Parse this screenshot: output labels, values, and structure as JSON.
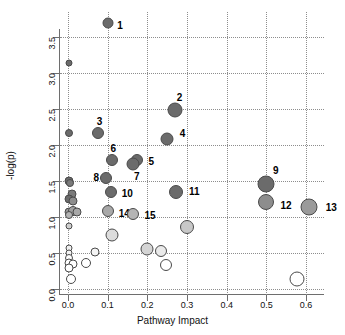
{
  "chart_data": {
    "type": "scatter",
    "title": "",
    "xlabel": "Pathway Impact",
    "ylabel": "-log(p)",
    "xlim": [
      -0.02,
      0.645
    ],
    "ylim": [
      -0.08,
      3.85
    ],
    "xticks": [
      0.0,
      0.1,
      0.2,
      0.3,
      0.4,
      0.5,
      0.6
    ],
    "xticklabels": [
      "0.0",
      "0.1",
      "0.2",
      "0.3",
      "0.4",
      "0.5",
      "0.6"
    ],
    "yticks": [
      0.0,
      0.5,
      1.0,
      1.5,
      2.0,
      2.5,
      3.0,
      3.5
    ],
    "yticklabels": [
      "0.0",
      "0.5",
      "1.0",
      "1.5",
      "2.0",
      "2.5",
      "3.0",
      "3.5"
    ],
    "grid": true,
    "grid_style": "dotted",
    "legend": "none",
    "marker_shape": "circle",
    "size_encodes": "pathway impact / node count",
    "color_encodes": "-log(p) significance, dark red-grey = high, white = low",
    "colors": {
      "high": "#6b6b6b",
      "mid": "#9a9a9a",
      "low": "#cfcfcf",
      "lowest": "#ffffff",
      "stroke": "#4a4a4a",
      "axis": "#6e6e6e",
      "grid": "#8d8d8d",
      "text": "#111111"
    },
    "points": [
      {
        "label": "1",
        "x": 0.1,
        "y": 3.7,
        "size": 11,
        "color": "#6b6b6b",
        "label_dx": 8,
        "label_dy": 2
      },
      {
        "label": "2",
        "x": 0.27,
        "y": 2.49,
        "size": 15,
        "color": "#6b6b6b",
        "label_dx": -2,
        "label_dy": -13
      },
      {
        "label": "3",
        "x": 0.075,
        "y": 2.17,
        "size": 12,
        "color": "#6b6b6b",
        "label_dx": -3,
        "label_dy": -12
      },
      {
        "label": "4",
        "x": 0.25,
        "y": 2.08,
        "size": 13,
        "color": "#6b6b6b",
        "label_dx": 10,
        "label_dy": -6
      },
      {
        "label": "5",
        "x": 0.175,
        "y": 1.8,
        "size": 12,
        "color": "#6b6b6b",
        "label_dx": 9,
        "label_dy": 1
      },
      {
        "label": "6",
        "x": 0.11,
        "y": 1.79,
        "size": 12,
        "color": "#6b6b6b",
        "label_dx": -3,
        "label_dy": -12
      },
      {
        "label": "7",
        "x": 0.165,
        "y": 1.74,
        "size": 13,
        "color": "#6b6b6b",
        "label_dx": -2,
        "label_dy": 12
      },
      {
        "label": "8",
        "x": 0.097,
        "y": 1.54,
        "size": 12,
        "color": "#6b6b6b",
        "label_dx": -15,
        "label_dy": -1
      },
      {
        "label": "9",
        "x": 0.5,
        "y": 1.455,
        "size": 17,
        "color": "#6b6b6b",
        "label_dx": 2,
        "label_dy": -14
      },
      {
        "label": "10",
        "x": 0.108,
        "y": 1.355,
        "size": 12,
        "color": "#6b6b6b",
        "label_dx": 9,
        "label_dy": 1
      },
      {
        "label": "11",
        "x": 0.272,
        "y": 1.35,
        "size": 14,
        "color": "#6b6b6b",
        "label_dx": 10,
        "label_dy": -1
      },
      {
        "label": "12",
        "x": 0.5,
        "y": 1.215,
        "size": 16,
        "color": "#8d8d8d",
        "label_dx": 10,
        "label_dy": 3
      },
      {
        "label": "13",
        "x": 0.608,
        "y": 1.145,
        "size": 17,
        "color": "#9a9a9a",
        "label_dx": 12,
        "label_dy": 0
      },
      {
        "label": "14",
        "x": 0.1,
        "y": 1.08,
        "size": 12,
        "color": "#a8a8a8",
        "label_dx": 9,
        "label_dy": 2
      },
      {
        "label": "15",
        "x": 0.165,
        "y": 1.05,
        "size": 12,
        "color": "#b4b4b4",
        "label_dx": 9,
        "label_dy": 1
      },
      {
        "label": "",
        "x": 0.003,
        "y": 3.145,
        "size": 7,
        "color": "#6b6b6b",
        "label_dx": 0,
        "label_dy": 0
      },
      {
        "label": "",
        "x": 0.003,
        "y": 2.175,
        "size": 8,
        "color": "#6b6b6b",
        "label_dx": 0,
        "label_dy": 0
      },
      {
        "label": "",
        "x": 0.003,
        "y": 1.5,
        "size": 9,
        "color": "#6b6b6b",
        "label_dx": 0,
        "label_dy": 0
      },
      {
        "label": "",
        "x": 0.004,
        "y": 1.47,
        "size": 8,
        "color": "#7b7b7b",
        "label_dx": 0,
        "label_dy": 0
      },
      {
        "label": "",
        "x": 0.01,
        "y": 1.32,
        "size": 9,
        "color": "#7b7b7b",
        "label_dx": 0,
        "label_dy": 0
      },
      {
        "label": "",
        "x": 0.003,
        "y": 1.26,
        "size": 9,
        "color": "#6b6b6b",
        "label_dx": 0,
        "label_dy": 0
      },
      {
        "label": "",
        "x": 0.012,
        "y": 1.225,
        "size": 9,
        "color": "#8d8d8d",
        "label_dx": 0,
        "label_dy": 0
      },
      {
        "label": "",
        "x": 0.002,
        "y": 1.075,
        "size": 9,
        "color": "#9a9a9a",
        "label_dx": 0,
        "label_dy": 0
      },
      {
        "label": "",
        "x": 0.012,
        "y": 1.085,
        "size": 10,
        "color": "#a0a0a0",
        "label_dx": 0,
        "label_dy": 0
      },
      {
        "label": "",
        "x": 0.022,
        "y": 1.07,
        "size": 9,
        "color": "#a8a8a8",
        "label_dx": 0,
        "label_dy": 0
      },
      {
        "label": "",
        "x": 0.003,
        "y": 1.03,
        "size": 8,
        "color": "#b4b4b4",
        "label_dx": 0,
        "label_dy": 0
      },
      {
        "label": "",
        "x": 0.002,
        "y": 0.88,
        "size": 7,
        "color": "#cfcfcf",
        "label_dx": 0,
        "label_dy": 0
      },
      {
        "label": "",
        "x": 0.002,
        "y": 0.575,
        "size": 7,
        "color": "#f0f0f0",
        "label_dx": 0,
        "label_dy": 0
      },
      {
        "label": "",
        "x": 0.002,
        "y": 0.5,
        "size": 7,
        "color": "#f4f4f4",
        "label_dx": 0,
        "label_dy": 0
      },
      {
        "label": "",
        "x": 0.002,
        "y": 0.43,
        "size": 8,
        "color": "#ffffff",
        "label_dx": 0,
        "label_dy": 0
      },
      {
        "label": "",
        "x": 0.003,
        "y": 0.37,
        "size": 9,
        "color": "#ffffff",
        "label_dx": 0,
        "label_dy": 0
      },
      {
        "label": "",
        "x": 0.013,
        "y": 0.355,
        "size": 9,
        "color": "#ffffff",
        "label_dx": 0,
        "label_dy": 0
      },
      {
        "label": "",
        "x": 0.003,
        "y": 0.29,
        "size": 9,
        "color": "#ffffff",
        "label_dx": 0,
        "label_dy": 0
      },
      {
        "label": "",
        "x": 0.008,
        "y": 0.145,
        "size": 10,
        "color": "#ffffff",
        "label_dx": 0,
        "label_dy": 0
      },
      {
        "label": "",
        "x": 0.045,
        "y": 0.365,
        "size": 10,
        "color": "#ffffff",
        "label_dx": 0,
        "label_dy": 0
      },
      {
        "label": "",
        "x": 0.068,
        "y": 0.515,
        "size": 9,
        "color": "#f4f4f4",
        "label_dx": 0,
        "label_dy": 0
      },
      {
        "label": "",
        "x": 0.112,
        "y": 0.755,
        "size": 13,
        "color": "#dcdcdc",
        "label_dx": 0,
        "label_dy": 0
      },
      {
        "label": "",
        "x": 0.2,
        "y": 0.56,
        "size": 13,
        "color": "#d4d4d4",
        "label_dx": 0,
        "label_dy": 0
      },
      {
        "label": "",
        "x": 0.235,
        "y": 0.525,
        "size": 12,
        "color": "#eaeaea",
        "label_dx": 0,
        "label_dy": 0
      },
      {
        "label": "",
        "x": 0.247,
        "y": 0.34,
        "size": 12,
        "color": "#ffffff",
        "label_dx": 0,
        "label_dy": 0
      },
      {
        "label": "",
        "x": 0.3,
        "y": 0.865,
        "size": 14,
        "color": "#c8c8c8",
        "label_dx": 0,
        "label_dy": 0
      },
      {
        "label": "",
        "x": 0.578,
        "y": 0.14,
        "size": 15,
        "color": "#ffffff",
        "label_dx": 0,
        "label_dy": 0
      }
    ]
  }
}
